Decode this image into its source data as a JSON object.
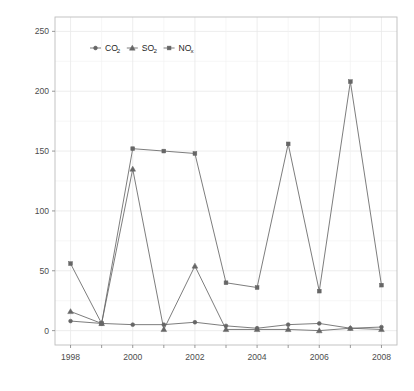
{
  "chart_data": {
    "type": "line",
    "title": "",
    "subtitle": "",
    "xlabel": "",
    "ylabel": "Bad output increase (%)",
    "x": [
      1998,
      1999,
      2000,
      2001,
      2002,
      2003,
      2004,
      2005,
      2006,
      2007,
      2008
    ],
    "xlim": [
      1997.5,
      2008.5
    ],
    "ylim": [
      -12,
      262
    ],
    "xticks_major": [
      1998,
      2000,
      2002,
      2004,
      2006,
      2008
    ],
    "xticks_minor": [
      1999,
      2001,
      2003,
      2005,
      2007
    ],
    "yticks": [
      0,
      50,
      100,
      150,
      200,
      250
    ],
    "ytick_labels": [
      "0",
      "50",
      "100",
      "150",
      "200",
      "250"
    ],
    "xtick_labels": [
      "1998",
      "2000",
      "2002",
      "2004",
      "2006",
      "2008"
    ],
    "grid": true,
    "grid_color": "#e8e8e8",
    "panel_background": "#ffffff",
    "panel_border_color": "#bdbdbd",
    "legend_position": "top-left-inside",
    "series": [
      {
        "name": "CO2",
        "display": "CO",
        "subscript": "2",
        "marker": "circle",
        "color": "#666666",
        "values": [
          8,
          6,
          5,
          5,
          7,
          4,
          2,
          5,
          6,
          2,
          3
        ]
      },
      {
        "name": "SO2",
        "display": "SO",
        "subscript": "2",
        "marker": "triangle",
        "color": "#666666",
        "values": [
          16,
          6,
          135,
          1,
          54,
          1,
          1,
          1,
          0,
          2,
          1
        ]
      },
      {
        "name": "NOx",
        "display": "NO",
        "subscript": "x",
        "marker": "square",
        "color": "#666666",
        "values": [
          56,
          6,
          152,
          150,
          148,
          40,
          36,
          156,
          33,
          208,
          38
        ]
      }
    ]
  },
  "legend": {
    "items": [
      {
        "base": "CO",
        "sub": "2",
        "marker": "circle"
      },
      {
        "base": "SO",
        "sub": "2",
        "marker": "triangle"
      },
      {
        "base": "NO",
        "sub": "x",
        "marker": "square"
      }
    ]
  },
  "axis": {
    "y_title": "Bad output increase (%)"
  }
}
